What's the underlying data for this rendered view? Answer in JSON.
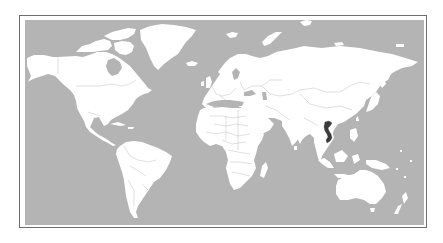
{
  "map": {
    "type": "world-locator-map",
    "projection": "equirectangular (cropped)",
    "highlighted_country": "Vietnam",
    "colors": {
      "ocean": "#b4b4b4",
      "land": "#ffffff",
      "borders": "#b9b9b9",
      "highlight": "#3a3a3a",
      "frame": "#6e6e6e",
      "page": "#ffffff"
    },
    "regions": [
      "North America",
      "Greenland",
      "South America",
      "Europe",
      "Africa",
      "Asia",
      "Australia",
      "New Zealand"
    ]
  }
}
